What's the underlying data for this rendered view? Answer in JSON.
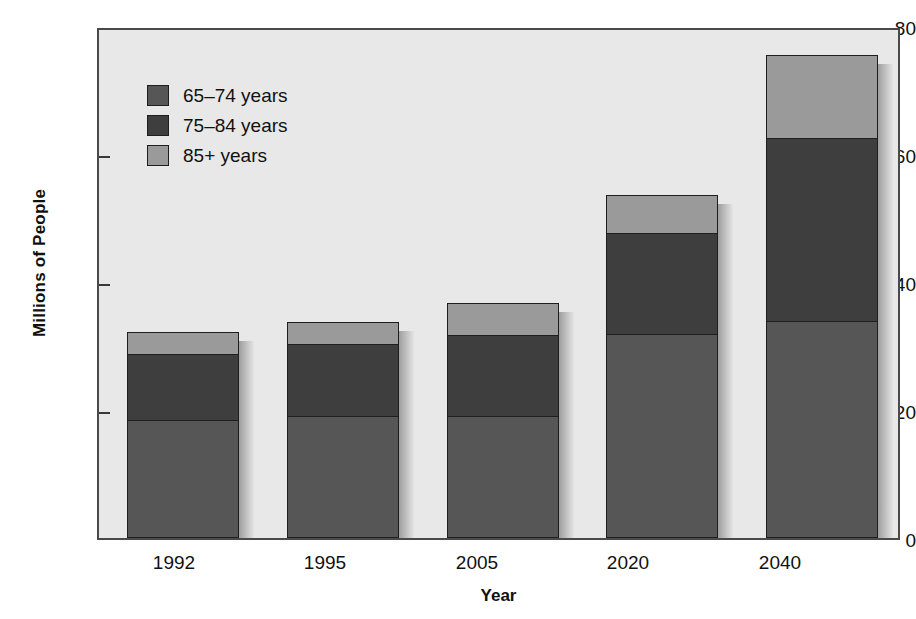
{
  "chart_data": {
    "type": "bar",
    "subtype": "stacked-bar",
    "title": "",
    "xlabel": "Year",
    "ylabel": "Millions of People",
    "categories": [
      "1992",
      "1995",
      "2005",
      "2020",
      "2040"
    ],
    "series": [
      {
        "name": "65–74 years",
        "color": "#565656",
        "values": [
          18.5,
          19,
          19,
          32,
          34
        ]
      },
      {
        "name": "75–84 years",
        "color": "#3e3e3e",
        "values": [
          10.5,
          11.5,
          13,
          16,
          29
        ]
      },
      {
        "name": "85+ years",
        "color": "#9a9a9a",
        "values": [
          3.5,
          3.5,
          5,
          6,
          13
        ]
      }
    ],
    "totals": [
      32.5,
      34,
      37,
      54,
      76
    ],
    "ylim": [
      0,
      80
    ],
    "yticks": [
      "0",
      "20",
      "40",
      "60",
      "80"
    ],
    "ytick_values": [
      0,
      20,
      40,
      60,
      80
    ],
    "grid": false,
    "legend_position": "upper-left-inside",
    "plot_background": "#e8e8e8",
    "axis_color": "#4a4a4a",
    "bar_edge_color": "#1e1e1e"
  },
  "legend": {
    "items": [
      {
        "label": "65–74 years",
        "color": "#565656"
      },
      {
        "label": "75–84 years",
        "color": "#3e3e3e"
      },
      {
        "label": "85+ years",
        "color": "#9a9a9a"
      }
    ]
  },
  "axes": {
    "y_title": "Millions of People",
    "x_title": "Year"
  }
}
